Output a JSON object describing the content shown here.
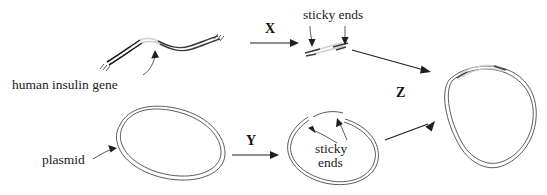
{
  "diagram": {
    "background_color": "#ffffff",
    "ink_color": "#1a1a1a",
    "gene_highlight_color": "#d9d9d9",
    "labels": {
      "human_insulin_gene": "human insulin gene",
      "plasmid": "plasmid",
      "sticky_ends_top": "sticky ends",
      "sticky_ends_bottom_line1": "sticky",
      "sticky_ends_bottom_line2": "ends"
    },
    "steps": [
      {
        "id": "X",
        "label": "X",
        "has_arrow": true
      },
      {
        "id": "Y",
        "label": "Y",
        "has_arrow": true
      },
      {
        "id": "Z",
        "label": "Z",
        "has_arrow": false
      }
    ],
    "stages": [
      {
        "name": "human-dna-strand",
        "caption": "human insulin gene"
      },
      {
        "name": "cut-gene-fragment",
        "caption": "sticky ends"
      },
      {
        "name": "intact-plasmid",
        "caption": "plasmid"
      },
      {
        "name": "cut-plasmid",
        "caption": "sticky ends"
      },
      {
        "name": "recombinant-plasmid",
        "caption": ""
      }
    ]
  }
}
